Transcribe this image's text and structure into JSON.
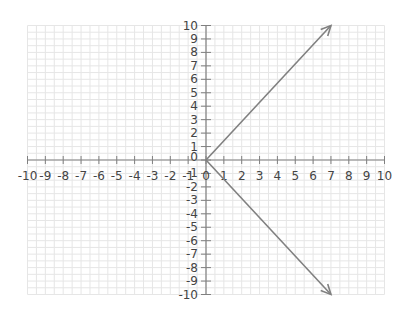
{
  "chart_data": {
    "type": "line",
    "title": "",
    "xlabel": "",
    "ylabel": "",
    "xlim": [
      -10,
      10
    ],
    "ylim": [
      -10,
      10
    ],
    "grid": true,
    "x_ticks": [
      -10,
      -9,
      -8,
      -7,
      -6,
      -5,
      -4,
      -3,
      -2,
      -1,
      0,
      1,
      2,
      3,
      4,
      5,
      6,
      7,
      8,
      9,
      10
    ],
    "y_ticks": [
      -10,
      -9,
      -8,
      -7,
      -6,
      -5,
      -4,
      -3,
      -2,
      -1,
      0,
      1,
      2,
      3,
      4,
      5,
      6,
      7,
      8,
      9,
      10
    ],
    "series": [
      {
        "name": "ray-up",
        "x": [
          0,
          7
        ],
        "y": [
          0,
          10
        ],
        "arrow_end": true
      },
      {
        "name": "ray-down",
        "x": [
          0,
          7
        ],
        "y": [
          0,
          -10
        ],
        "arrow_end": true
      }
    ],
    "legend": null
  },
  "style": {
    "axis_color": "#808080",
    "grid_color": "#e6e6e6",
    "line_color": "#808080",
    "label_color": "#444444"
  }
}
